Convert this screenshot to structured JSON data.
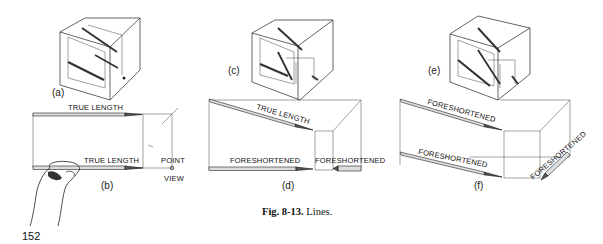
{
  "page_number": "152",
  "caption": {
    "bold": "Fig. 8-13.",
    "text": " Lines."
  },
  "panels": {
    "a": {
      "label": "(a)"
    },
    "b": {
      "label": "(b)",
      "top_line": "TRUE LENGTH",
      "bottom_line": "TRUE LENGTH",
      "point_view": [
        "POINT",
        "VIEW"
      ]
    },
    "c": {
      "label": "(c)"
    },
    "d": {
      "label": "(d)",
      "top_line": "TRUE LENGTH",
      "bottom_line": "FORESHORTENED",
      "side_line": "FORESHORTENED"
    },
    "e": {
      "label": "(e)"
    },
    "f": {
      "label": "(f)",
      "top_line": "FORESHORTENED",
      "bottom_line": "FORESHORTENED",
      "side_line": "FORESHORTENED"
    }
  }
}
